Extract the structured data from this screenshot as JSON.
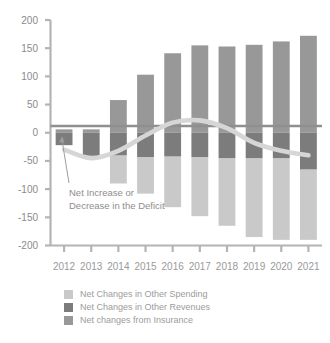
{
  "chart_data": {
    "type": "bar",
    "title": "",
    "subtitle": "",
    "xlabel": "",
    "ylabel": "",
    "categories": [
      "2012",
      "2013",
      "2014",
      "2015",
      "2016",
      "2017",
      "2018",
      "2019",
      "2020",
      "2021"
    ],
    "ylim": [
      -200,
      200
    ],
    "yticks": [
      200,
      150,
      100,
      50,
      0,
      -50,
      -100,
      -150,
      -200
    ],
    "ytick_labels": [
      "200",
      "150",
      "100",
      "50",
      "0",
      "-50",
      "-100",
      "-150",
      "-200"
    ],
    "grid": false,
    "stacked": true,
    "legend_position": "bottom",
    "series": [
      {
        "name": "Net Changes in Other Spending",
        "color": "#c9c9c9",
        "values": [
          0,
          0,
          -50,
          -65,
          -90,
          -105,
          -120,
          -140,
          -145,
          -125
        ]
      },
      {
        "name": "Net Changes in Other Revenues",
        "color": "#7c7c7c",
        "values": [
          -22,
          -45,
          -40,
          -43,
          -42,
          -43,
          -45,
          -45,
          -45,
          -65
        ]
      },
      {
        "name": "Net changes from Insurance",
        "color": "#989898",
        "values": [
          6,
          6,
          58,
          103,
          141,
          155,
          153,
          156,
          162,
          172
        ]
      }
    ],
    "line_series": {
      "name": "Net Increase or Decrease in the Deficit",
      "color": "#d6d6d6",
      "values": [
        -30,
        -45,
        -32,
        -5,
        18,
        22,
        8,
        -18,
        -32,
        -40
      ]
    },
    "annotations": [
      {
        "name": "deficit-callout",
        "line1": "Net Increase or",
        "line2": "Decrease in the Deficit"
      }
    ]
  },
  "legend": {
    "items": [
      {
        "label": "Net Changes in Other Spending",
        "color": "#c9c9c9"
      },
      {
        "label": "Net Changes in Other Revenues",
        "color": "#7c7c7c"
      },
      {
        "label": "Net changes from Insurance",
        "color": "#989898"
      }
    ]
  },
  "axis": {
    "y_labels": [
      "200",
      "150",
      "100",
      "50",
      "0",
      "-50",
      "-100",
      "-150",
      "-200"
    ],
    "x_labels": [
      "2012",
      "2013",
      "2014",
      "2015",
      "2016",
      "2017",
      "2018",
      "2019",
      "2020",
      "2021"
    ]
  },
  "colors": {
    "spending": "#c9c9c9",
    "revenues": "#7c7c7c",
    "insurance": "#989898",
    "line": "#d6d6d6",
    "axis": "#b4b4b4",
    "zero_line": "#8f8f8f",
    "text": "#8f8f8f",
    "background": "#ffffff"
  }
}
